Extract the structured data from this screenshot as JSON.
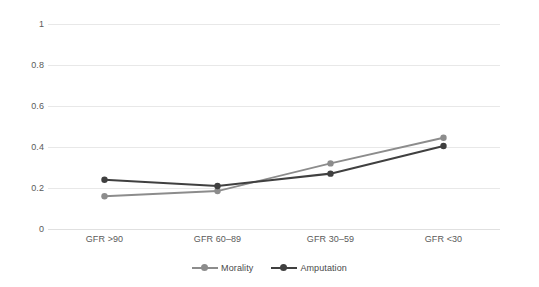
{
  "chart_data": {
    "type": "line",
    "title": "",
    "xlabel": "",
    "ylabel": "",
    "categories": [
      "GFR >90",
      "GFR 60–89",
      "GFR 30–59",
      "GFR <30"
    ],
    "series": [
      {
        "name": "Morality",
        "color": "#8c8c8c",
        "values": [
          0.16,
          0.185,
          0.32,
          0.445
        ]
      },
      {
        "name": "Amputation",
        "color": "#404040",
        "values": [
          0.24,
          0.21,
          0.27,
          0.405
        ]
      }
    ],
    "ylim": [
      0,
      1
    ],
    "yticks": [
      "0",
      "0.2",
      "0.4",
      "0.6",
      "0.8",
      "1"
    ],
    "ytick_values": [
      0,
      0.2,
      0.4,
      0.6,
      0.8,
      1
    ],
    "grid": true,
    "grid_color": "#e8e8e8",
    "legend_position": "bottom",
    "marker": "circle",
    "background": "#ffffff"
  },
  "legend": {
    "entries": [
      {
        "label": "Morality",
        "color": "#8c8c8c"
      },
      {
        "label": "Amputation",
        "color": "#404040"
      }
    ]
  }
}
